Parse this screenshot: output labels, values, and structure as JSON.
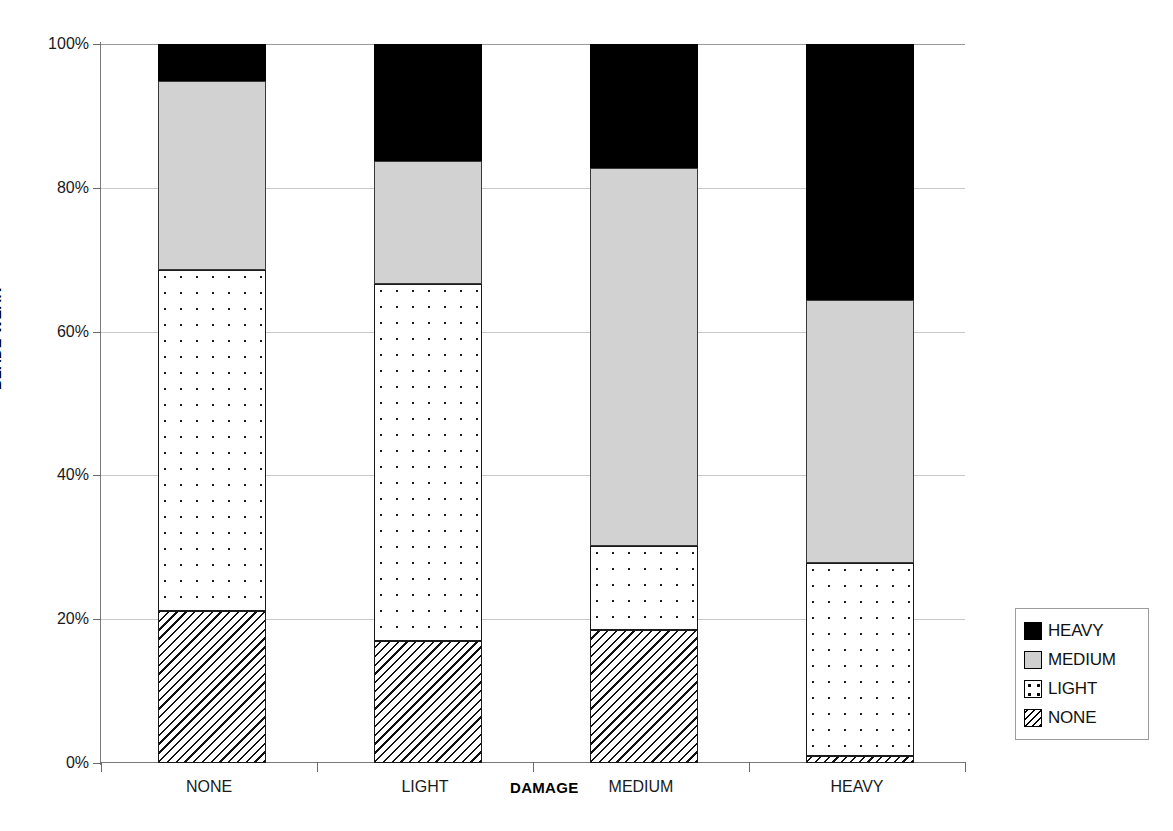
{
  "chart_data": {
    "type": "bar",
    "subtype": "stacked-percent",
    "title": "",
    "xlabel": "DAMAGE",
    "ylabel": "BLADE WEAR",
    "categories": [
      "NONE",
      "LIGHT",
      "MEDIUM",
      "HEAVY"
    ],
    "series": [
      {
        "name": "NONE",
        "values": [
          21.1,
          17.0,
          18.5,
          1.0
        ]
      },
      {
        "name": "LIGHT",
        "values": [
          47.5,
          49.6,
          11.7,
          26.8
        ]
      },
      {
        "name": "MEDIUM",
        "values": [
          26.3,
          17.1,
          52.6,
          36.6
        ]
      },
      {
        "name": "HEAVY",
        "values": [
          5.1,
          16.3,
          17.2,
          35.6
        ]
      }
    ],
    "ylim": [
      0,
      100
    ],
    "ytick_labels": [
      "0%",
      "20%",
      "40%",
      "60%",
      "80%",
      "100%"
    ],
    "ytick_values": [
      0,
      20,
      40,
      60,
      80,
      100
    ],
    "grid": true,
    "grid_axis": "y",
    "legend_position": "right",
    "stack_order_bottom_to_top": [
      "NONE",
      "LIGHT",
      "MEDIUM",
      "HEAVY"
    ],
    "colors": {
      "HEAVY": "#000000",
      "MEDIUM": "#d2d2d2",
      "LIGHT": "#ffffff",
      "NONE": "#ffffff",
      "gridline": "#c9c9c9",
      "axis": "#7a7a7a"
    },
    "patterns": {
      "HEAVY": "solid-black",
      "MEDIUM": "solid-gray",
      "LIGHT": "dotted",
      "NONE": "diagonal-hatch"
    }
  },
  "axes": {
    "y_title": "BLADE WEAR",
    "x_title": "DAMAGE",
    "y_ticks": [
      {
        "label": "100%",
        "value": 100
      },
      {
        "label": "80%",
        "value": 80
      },
      {
        "label": "60%",
        "value": 60
      },
      {
        "label": "40%",
        "value": 40
      },
      {
        "label": "20%",
        "value": 20
      },
      {
        "label": "0%",
        "value": 0
      }
    ],
    "x_ticks": [
      {
        "label": "NONE"
      },
      {
        "label": "LIGHT"
      },
      {
        "label": "MEDIUM"
      },
      {
        "label": "HEAVY"
      }
    ]
  },
  "legend": {
    "entries": [
      {
        "label": "HEAVY",
        "swatch": "black-solid-swatch"
      },
      {
        "label": "MEDIUM",
        "swatch": "gray-solid-swatch"
      },
      {
        "label": "LIGHT",
        "swatch": "dotted-swatch"
      },
      {
        "label": "NONE",
        "swatch": "hatched-swatch"
      }
    ]
  }
}
